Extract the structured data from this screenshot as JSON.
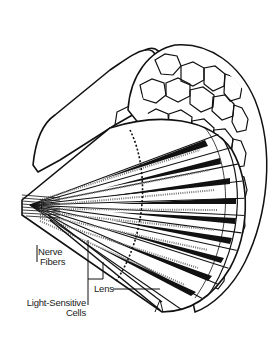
{
  "diagram": {
    "labels": {
      "nerve_fibers": [
        "Nerve",
        "Fibers"
      ],
      "light_sensitive_cells": [
        "Light-Sensitive",
        "Cells"
      ],
      "lens": "Lens"
    },
    "colors": {
      "ink": "#111111",
      "background": "#ffffff",
      "fill": "#ffffff",
      "stipple": "#777777"
    }
  }
}
